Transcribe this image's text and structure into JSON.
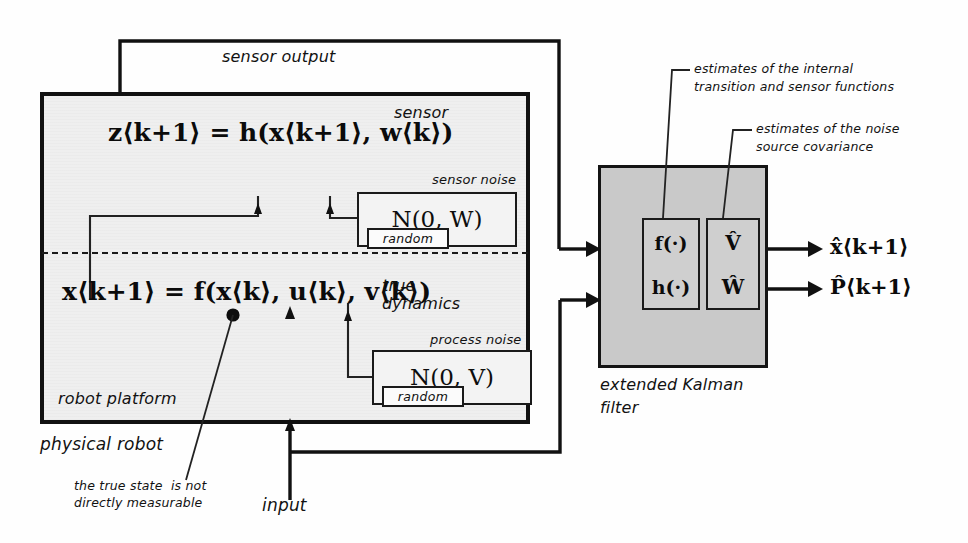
{
  "diagram": {
    "colors": {
      "ink": "#111111",
      "robot_fill": "#efefef",
      "ekf_fill": "#c9c9c9",
      "inner_fill": "#cfcfcf",
      "noise_fill": "#f3f3f3"
    }
  },
  "robot": {
    "outer_label": "physical robot",
    "platform_label": "robot platform",
    "sensor_label": "sensor",
    "sensor_output_label": "sensor output",
    "true_dynamics_label_line1": "true",
    "true_dynamics_label_line2": "dynamics",
    "sensor_equation": "z⟨k+1⟩ = h(x⟨k+1⟩, w⟨k⟩)",
    "dynamics_equation": "x⟨k+1⟩ = f(x⟨k⟩, u⟨k⟩, v⟨k⟩)"
  },
  "noise": {
    "sensor": {
      "caption": "sensor noise",
      "distribution": "N(0, W)",
      "random_label": "random"
    },
    "process": {
      "caption": "process noise",
      "distribution": "N(0, V)",
      "random_label": "random"
    }
  },
  "ekf": {
    "caption_line1": "extended Kalman",
    "caption_line2": "filter",
    "functions_box": {
      "top": "f(·)",
      "bottom": "h(·)"
    },
    "covariance_box": {
      "top": "V̂",
      "bottom": "Ŵ"
    },
    "outputs": [
      {
        "name": "state-estimate",
        "label": "x̂⟨k+1⟩"
      },
      {
        "name": "covariance-estimate",
        "label": "P̂⟨k+1⟩"
      }
    ]
  },
  "annotations": {
    "estimates_functions_line1": "estimates of the internal",
    "estimates_functions_line2": "transition and sensor functions",
    "estimates_noise_line1": "estimates of the noise",
    "estimates_noise_line2": "source covariance",
    "true_state_line1": "the true state  is not",
    "true_state_line2": "directly measurable",
    "input_label": "input"
  }
}
